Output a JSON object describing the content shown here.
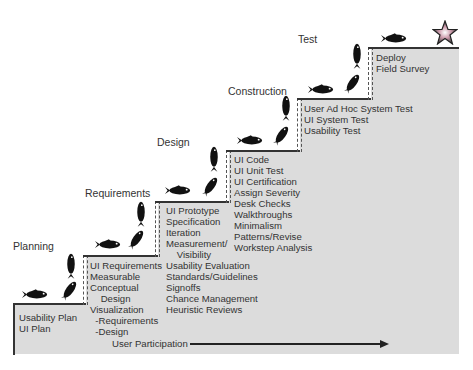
{
  "phases": [
    "Planning",
    "Requirements",
    "Design",
    "Construction",
    "Test"
  ],
  "steps": [
    {
      "items": "Usability Plan\nUI Plan"
    },
    {
      "items": "UI Requirements\nMeasurable\nConceptual\n    Design\nVisualization\n  -Requirements\n  -Design"
    },
    {
      "items": "UI Prototype\nSpecification\nIteration\nMeasurement/\n    Visibility\nUsability Evaluation\nStandards/Guidelines\nSignoffs\nChance Management\nHeuristic Reviews"
    },
    {
      "items": "UI Code\nUI Unit Test\nUI Certification\nAssign Severity\nDesk Checks\nWalkthroughs\nMinimalism\nPatterns/Revise\nWorkstep Analysis"
    },
    {
      "items": "User Ad Hoc System Test\nUI System Test\nUsability Test"
    },
    {
      "items": "Deploy\nField Survey"
    }
  ],
  "user_participation": "User Participation",
  "icons": {
    "fish": "fish-icon",
    "star": "star-icon"
  },
  "colors": {
    "fill": "#dcdcdc",
    "line": "#333333"
  }
}
